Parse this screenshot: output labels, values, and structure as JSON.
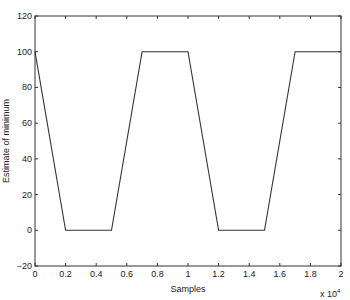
{
  "chart_data": {
    "type": "line",
    "title": "",
    "xlabel": "Samples",
    "ylabel": "Estimate of minimum",
    "x_multiplier": "x 10^4",
    "xlim": [
      0,
      2
    ],
    "ylim": [
      -20,
      120
    ],
    "grid": false,
    "legend": null,
    "x_ticks": [
      "0",
      "0.2",
      "0.4",
      "0.6",
      "0.8",
      "1",
      "1.2",
      "1.4",
      "1.6",
      "1.8",
      "2"
    ],
    "y_ticks": [
      "-20",
      "0",
      "20",
      "40",
      "60",
      "80",
      "100",
      "120"
    ],
    "series": [
      {
        "name": "estimate",
        "x": [
          0,
          0.2,
          0.5,
          0.7,
          1.0,
          1.2,
          1.5,
          1.7,
          2.0
        ],
        "y": [
          100,
          0,
          0,
          100,
          100,
          0,
          0,
          100,
          100
        ]
      }
    ]
  }
}
